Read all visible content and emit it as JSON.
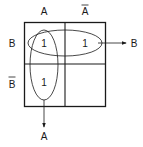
{
  "diagram": {
    "type": "karnaugh-map",
    "column_headers": [
      "A",
      "A"
    ],
    "column_header_overbar": [
      false,
      true
    ],
    "row_headers": [
      "B",
      "B"
    ],
    "row_header_overbar": [
      false,
      true
    ],
    "cells": [
      [
        "1",
        "1"
      ],
      [
        "1",
        ""
      ]
    ],
    "groupings": [
      {
        "name": "horizontal-group",
        "cells": "row B",
        "output_label": "B"
      },
      {
        "name": "vertical-group",
        "cells": "column A",
        "output_label": "A"
      }
    ],
    "line_color": "#1a1a1a"
  }
}
